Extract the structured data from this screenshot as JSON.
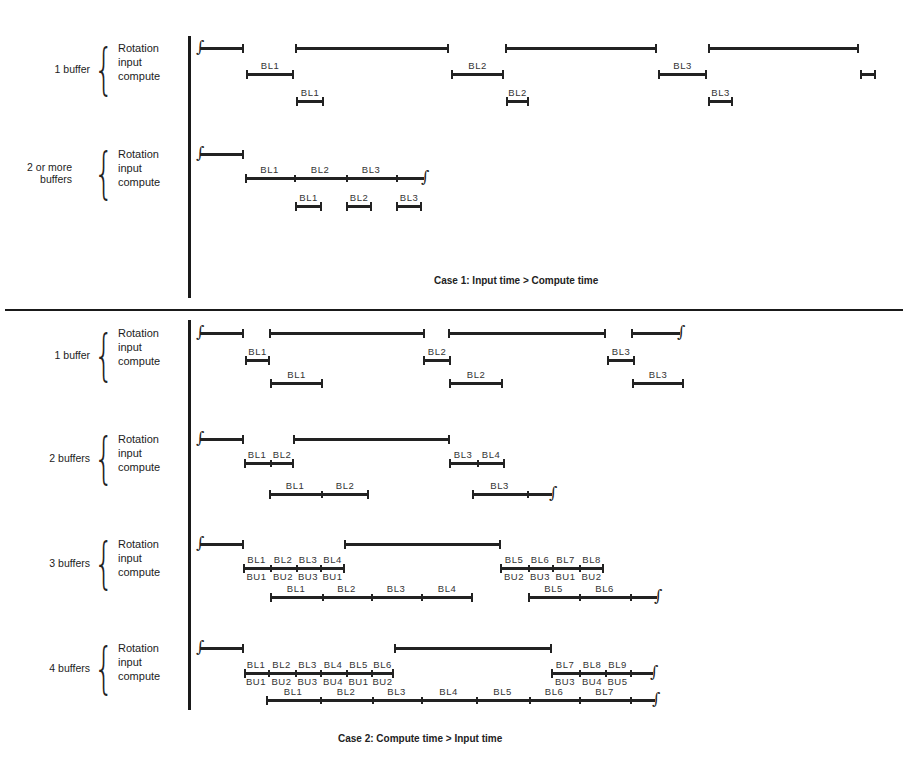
{
  "figure": {
    "case1": {
      "caption": "Case 1:  Input time > Compute time",
      "groups": [
        {
          "label": "1 buffer",
          "rows": [
            "Rotation",
            "input",
            "compute"
          ],
          "rotation_y": 47,
          "input_y": 73,
          "compute_y": 100,
          "rotation": [
            [
              200,
              244,
              "start"
            ],
            [
              295,
              449
            ],
            [
              505,
              657
            ],
            [
              708,
              859
            ]
          ],
          "input": [
            [
              246,
              294,
              "BL1"
            ],
            [
              451,
              504,
              "BL2"
            ],
            [
              658,
              707,
              "BL3"
            ],
            [
              860,
              876,
              ""
            ]
          ],
          "compute": [
            [
              296,
              324,
              "BL1"
            ],
            [
              506,
              529,
              "BL2"
            ],
            [
              708,
              733,
              "BL3"
            ]
          ]
        },
        {
          "label": "2 or more buffers",
          "rows": [
            "Rotation",
            "input",
            "compute"
          ],
          "rotation_y": 153,
          "input_y": 177,
          "compute_y": 205,
          "rotation": [
            [
              200,
              244,
              "start"
            ]
          ],
          "input_chain": {
            "x0": 245,
            "x1": 424,
            "ticks": [
              294,
              346,
              396
            ],
            "labels": [
              "BL1",
              "BL2",
              "BL3"
            ],
            "end": "wavy"
          },
          "compute": [
            [
              295,
              322,
              "BL1"
            ],
            [
              346,
              372,
              "BL2"
            ],
            [
              396,
              422,
              "BL3"
            ]
          ]
        }
      ]
    },
    "case2": {
      "caption": "Case 2:  Compute time > Input time",
      "groups": [
        {
          "label": "1 buffer",
          "rows": [
            "Rotation",
            "input",
            "compute"
          ],
          "rotation_y": 332,
          "input_y": 359,
          "compute_y": 382,
          "rotation": [
            [
              200,
              244,
              "start"
            ],
            [
              269,
              425
            ],
            [
              448,
              606
            ],
            [
              631,
              680,
              "wavy"
            ]
          ],
          "input": [
            [
              245,
              270,
              "BL1"
            ],
            [
              423,
              451,
              "BL2"
            ],
            [
              607,
              635,
              "BL3"
            ]
          ],
          "compute": [
            [
              270,
              323,
              "BL1"
            ],
            [
              449,
              503,
              "BL2"
            ],
            [
              632,
              684,
              "BL3"
            ]
          ]
        },
        {
          "label": "2 buffers",
          "rows": [
            "Rotation",
            "input",
            "compute"
          ],
          "rotation_y": 438,
          "input_y": 462,
          "compute_y": 493,
          "rotation": [
            [
              200,
              244,
              "start"
            ],
            [
              293,
              450
            ]
          ],
          "input_chains": [
            {
              "x0": 244,
              "x1": 294,
              "ticks": [
                270
              ],
              "labels": [
                "BL1",
                "BL2"
              ],
              "end": "cap"
            },
            {
              "x0": 449,
              "x1": 505,
              "ticks": [
                477
              ],
              "labels": [
                "BL3",
                "BL4"
              ],
              "end": "cap"
            }
          ],
          "compute_chains": [
            {
              "x0": 269,
              "x1": 369,
              "ticks": [
                321
              ],
              "labels": [
                "BL1",
                "BL2"
              ],
              "end": "cap"
            },
            {
              "x0": 472,
              "x1": 552,
              "ticks": [
                527
              ],
              "labels": [
                "BL3"
              ],
              "end": "wavy"
            }
          ]
        },
        {
          "label": "3 buffers",
          "rows": [
            "Rotation",
            "input",
            "compute"
          ],
          "rotation_y": 543,
          "input_y": 567,
          "compute_y": 596,
          "rotation": [
            [
              200,
              244,
              "start"
            ],
            [
              344,
              501
            ]
          ],
          "input_chains": [
            {
              "x0": 243,
              "x1": 345,
              "ticks": [
                270,
                296,
                320
              ],
              "labels": [
                "BL1",
                "BL2",
                "BL3",
                "BL4"
              ],
              "sublabels": [
                "BU1",
                "BU2",
                "BU3",
                "BU1"
              ],
              "end": "cap"
            },
            {
              "x0": 500,
              "x1": 604,
              "ticks": [
                528,
                552,
                579
              ],
              "labels": [
                "BL5",
                "BL6",
                "BL7",
                "BL8"
              ],
              "sublabels": [
                "BU2",
                "BU3",
                "BU1",
                "BU2"
              ],
              "end": "cap"
            }
          ],
          "compute_chains": [
            {
              "x0": 270,
              "x1": 473,
              "ticks": [
                322,
                371,
                421
              ],
              "labels": [
                "BL1",
                "BL2",
                "BL3",
                "BL4"
              ],
              "end": "cap"
            },
            {
              "x0": 528,
              "x1": 657,
              "ticks": [
                579,
                630
              ],
              "labels": [
                "BL5",
                "BL6"
              ],
              "end": "wavy"
            }
          ]
        },
        {
          "label": "4 buffers",
          "rows": [
            "Rotation",
            "input",
            "compute"
          ],
          "rotation_y": 647,
          "input_y": 672,
          "compute_y": 699,
          "rotation": [
            [
              200,
              244,
              "start"
            ],
            [
              394,
              552
            ]
          ],
          "input_chains": [
            {
              "x0": 244,
              "x1": 394,
              "ticks": [
                268,
                295,
                320,
                346,
                371
              ],
              "labels": [
                "BL1",
                "BL2",
                "BL3",
                "BL4",
                "BL5",
                "BL6"
              ],
              "sublabels": [
                "BU1",
                "BU2",
                "BU3",
                "BU4",
                "BU1",
                "BU2"
              ],
              "end": "cap"
            },
            {
              "x0": 551,
              "x1": 653,
              "ticks": [
                579,
                605,
                630
              ],
              "labels": [
                "BL7",
                "BL8",
                "BL9"
              ],
              "sublabels": [
                "BU3",
                "BU4",
                "BU5"
              ],
              "end": "wavy"
            }
          ],
          "compute_chains": [
            {
              "x0": 266,
              "x1": 655,
              "ticks": [
                320,
                372,
                421,
                476,
                529,
                579,
                630
              ],
              "labels": [
                "BL1",
                "BL2",
                "BL3",
                "BL4",
                "BL5",
                "BL6",
                "BL7"
              ],
              "end": "wavy"
            }
          ]
        }
      ]
    },
    "icons": {
      "brace": "{",
      "wavy_end": "∫"
    },
    "colors": {
      "ink": "#222222",
      "background": "#ffffff"
    }
  }
}
